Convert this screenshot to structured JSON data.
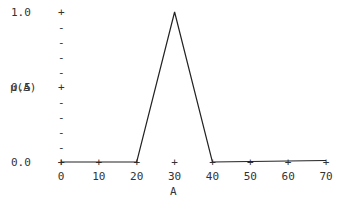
{
  "chart_data": {
    "type": "line",
    "title": "",
    "xlabel": "A",
    "ylabel": "μ(A)",
    "x": [
      0,
      20,
      30,
      40,
      70
    ],
    "series": [
      {
        "name": "μ(A)",
        "values": [
          0.0,
          0.0,
          1.0,
          0.0,
          0.01
        ]
      }
    ],
    "xlim": [
      0,
      70
    ],
    "ylim": [
      0.0,
      1.0
    ],
    "x_ticks": [
      "0",
      "10",
      "20",
      "30",
      "40",
      "50",
      "60",
      "70"
    ],
    "y_ticks": [
      "0.0",
      "0.5",
      "1.0"
    ],
    "grid": false,
    "legend": "none"
  },
  "colors": {
    "line": "#222222",
    "text": "#333333",
    "background": "#ffffff"
  }
}
